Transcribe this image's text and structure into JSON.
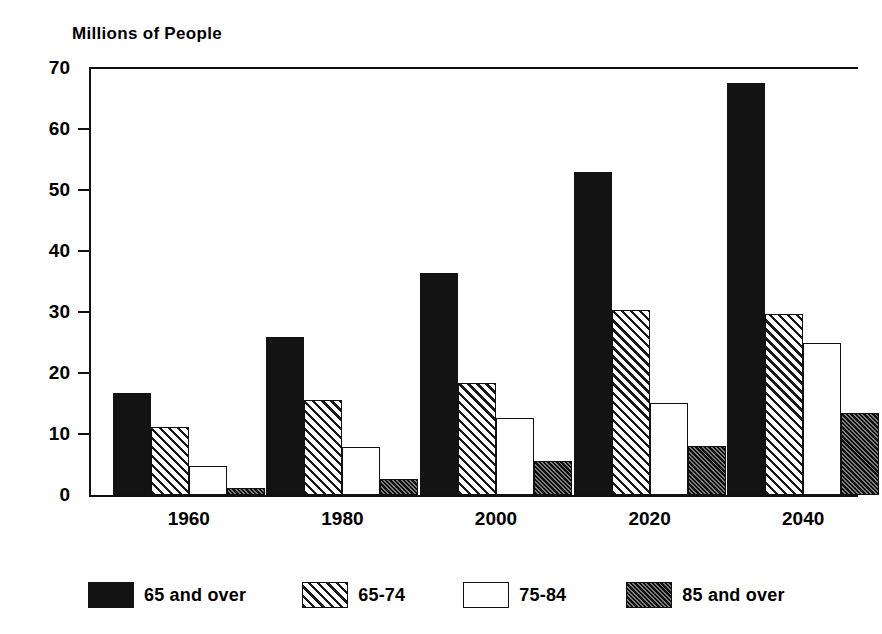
{
  "chart_data": {
    "type": "bar",
    "title": "Millions of People",
    "subtitle": "",
    "xlabel": "",
    "ylabel": "",
    "ylim": [
      0,
      70
    ],
    "yticks": [
      0,
      10,
      20,
      30,
      40,
      50,
      60,
      70
    ],
    "ytick_labels": [
      "0",
      "10",
      "20",
      "30",
      "40",
      "50",
      "60",
      "70"
    ],
    "grid": false,
    "legend_position": "bottom",
    "categories": [
      "1960",
      "1980",
      "2000",
      "2020",
      "2040"
    ],
    "series": [
      {
        "name": "65 and over",
        "pattern": "solid-black",
        "color": "#131313",
        "values": [
          16.7,
          25.9,
          36.4,
          53.0,
          67.5
        ]
      },
      {
        "name": "65-74",
        "pattern": "light-diagonal-hatch",
        "color": "#ffffff",
        "values": [
          11.1,
          15.6,
          18.4,
          30.3,
          29.6
        ]
      },
      {
        "name": "75-84",
        "pattern": "empty-white",
        "color": "#ffffff",
        "values": [
          4.8,
          7.8,
          12.6,
          15.1,
          24.9
        ]
      },
      {
        "name": "85 and over",
        "pattern": "dense-dark-hatch",
        "color": "#3a3a3a",
        "values": [
          1.1,
          2.7,
          5.6,
          8.0,
          13.5
        ]
      }
    ]
  },
  "legend": {
    "items": [
      {
        "label": "65 and over"
      },
      {
        "label": "65-74"
      },
      {
        "label": "75-84"
      },
      {
        "label": "85 and over"
      }
    ]
  }
}
